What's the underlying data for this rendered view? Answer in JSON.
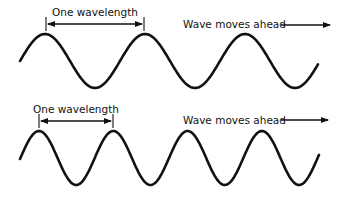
{
  "panels": [
    {
      "id": "long-wavelength",
      "wavelength_label": "One wavelength",
      "direction_label": "Wave moves ahead",
      "wave": {
        "start_x": 20,
        "end_x": 318,
        "center_y": 61,
        "amplitude": 27,
        "period": 100,
        "first_peak_x": 45
      },
      "wavelength_marker": {
        "x1": 46,
        "x2": 144,
        "y": 24
      }
    },
    {
      "id": "short-wavelength",
      "wavelength_label": "One wavelength",
      "direction_label": "Wave moves ahead",
      "wave": {
        "start_x": 20,
        "end_x": 319,
        "center_y": 158,
        "amplitude": 27,
        "period": 74.3,
        "first_peak_x": 39
      },
      "wavelength_marker": {
        "x1": 39,
        "x2": 113,
        "y": 121
      }
    }
  ],
  "colors": {
    "ink": "#111111",
    "background": "#ffffff"
  }
}
